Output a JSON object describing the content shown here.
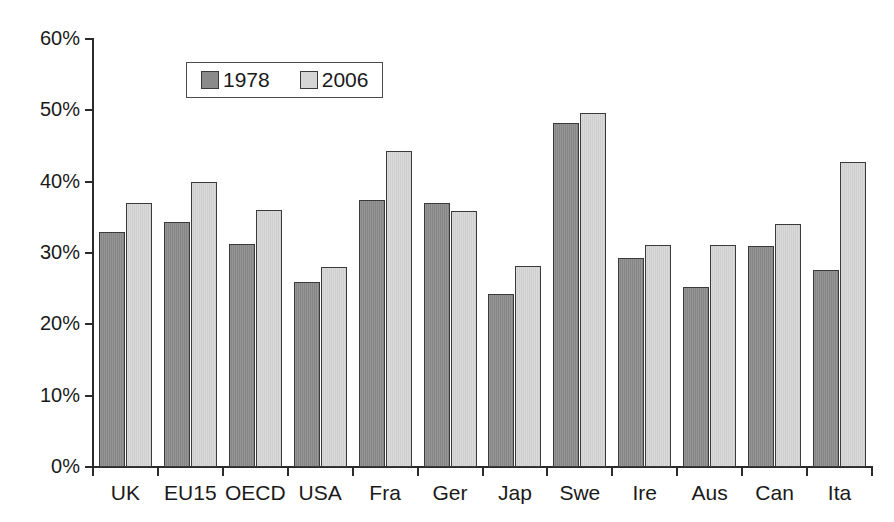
{
  "chart_data": {
    "type": "bar",
    "title": "",
    "subtitle": "",
    "xlabel": "",
    "ylabel": "",
    "ylim": [
      0,
      60
    ],
    "ytick_labels": [
      "0%",
      "10%",
      "20%",
      "30%",
      "40%",
      "50%",
      "60%"
    ],
    "ytick_values": [
      0,
      10,
      20,
      30,
      40,
      50,
      60
    ],
    "grid": false,
    "legend_position": "upper-left-inside",
    "categories": [
      "UK",
      "EU15",
      "OECD",
      "USA",
      "Fra",
      "Ger",
      "Jap",
      "Swe",
      "Ire",
      "Aus",
      "Can",
      "Ita"
    ],
    "series": [
      {
        "name": "1978",
        "color": "#8a8a8a",
        "values": [
          33.0,
          34.3,
          31.3,
          26.0,
          37.5,
          37.0,
          24.3,
          48.2,
          29.3,
          25.3,
          31.0,
          27.6
        ]
      },
      {
        "name": "2006",
        "color": "#d6d6d6",
        "values": [
          37.0,
          39.9,
          36.0,
          28.0,
          44.3,
          35.9,
          28.2,
          49.6,
          31.1,
          31.1,
          34.0,
          42.7
        ]
      }
    ]
  },
  "legend": {
    "entries": [
      {
        "label": "1978"
      },
      {
        "label": "2006"
      }
    ]
  },
  "colors": {
    "series_1978": "#8a8a8a",
    "series_2006": "#d6d6d6",
    "axis": "#2b2b2b",
    "background": "#ffffff"
  }
}
